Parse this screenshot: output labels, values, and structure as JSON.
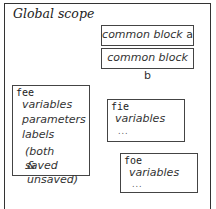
{
  "diagram": {
    "title": "Global scope",
    "common_blocks": [
      {
        "label": "common block",
        "suffix": "a"
      },
      {
        "label": "common block",
        "suffix": "b"
      }
    ],
    "routines": [
      {
        "name": "fee",
        "lines": [
          "variables",
          "parameters",
          "labels"
        ],
        "note": [
          "(both saved",
          "& unsaved)"
        ]
      },
      {
        "name": "fie",
        "lines": [
          "variables"
        ],
        "ellipsis": "..."
      },
      {
        "name": "foe",
        "lines": [
          "variables"
        ],
        "ellipsis": "..."
      }
    ]
  }
}
